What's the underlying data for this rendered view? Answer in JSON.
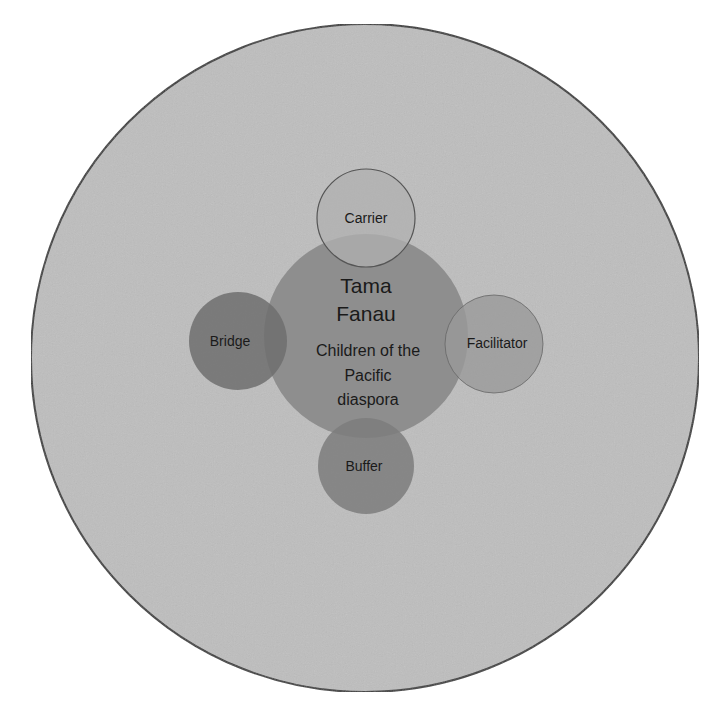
{
  "diagram": {
    "type": "concentric-venn",
    "outer": {
      "label": "",
      "color": "#bebebe",
      "stroke": "#3a3a3a"
    },
    "center": {
      "title_lines": [
        "Tama",
        "Fanau"
      ],
      "subtitle_lines": [
        "Children of the",
        "Pacific",
        "diaspora"
      ],
      "color": "#8a8a8a"
    },
    "roles": [
      {
        "id": "carrier",
        "label": "Carrier",
        "position": "top",
        "color": "#b0b0b0",
        "opacity": 0.75
      },
      {
        "id": "bridge",
        "label": "Bridge",
        "position": "left",
        "color": "#6e6e6e",
        "opacity": 0.85
      },
      {
        "id": "facilitator",
        "label": "Facilitator",
        "position": "right",
        "color": "#9a9a9a",
        "opacity": 0.8
      },
      {
        "id": "buffer",
        "label": "Buffer",
        "position": "bottom",
        "color": "#7c7c7c",
        "opacity": 0.85
      }
    ]
  }
}
